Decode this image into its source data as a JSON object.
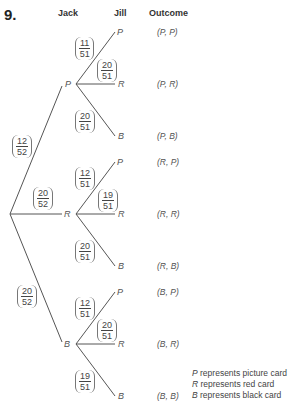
{
  "question_number": "9.",
  "headers": {
    "jack": "Jack",
    "jill": "Jill",
    "outcome": "Outcome"
  },
  "first_level": [
    {
      "node": "P",
      "probability": {
        "num": "12",
        "den": "52"
      }
    },
    {
      "node": "R",
      "probability": {
        "num": "20",
        "den": "52"
      }
    },
    {
      "node": "B",
      "probability": {
        "num": "20",
        "den": "52"
      }
    }
  ],
  "second_level": {
    "P": [
      {
        "node": "P",
        "probability": {
          "num": "11",
          "den": "51"
        },
        "outcome": "(P, P)"
      },
      {
        "node": "R",
        "probability": {
          "num": "20",
          "den": "51"
        },
        "outcome": "(P, R)"
      },
      {
        "node": "B",
        "probability": {
          "num": "20",
          "den": "51"
        },
        "outcome": "(P, B)"
      }
    ],
    "R": [
      {
        "node": "P",
        "probability": {
          "num": "12",
          "den": "51"
        },
        "outcome": "(R, P)"
      },
      {
        "node": "R",
        "probability": {
          "num": "19",
          "den": "51"
        },
        "outcome": "(R, R)"
      },
      {
        "node": "B",
        "probability": {
          "num": "20",
          "den": "51"
        },
        "outcome": "(R, B)"
      }
    ],
    "B": [
      {
        "node": "P",
        "probability": {
          "num": "12",
          "den": "51"
        },
        "outcome": "(B, P)"
      },
      {
        "node": "R",
        "probability": {
          "num": "20",
          "den": "51"
        },
        "outcome": "(B, R)"
      },
      {
        "node": "B",
        "probability": {
          "num": "19",
          "den": "51"
        },
        "outcome": "(B, B)"
      }
    ]
  },
  "legend": [
    {
      "symbol": "P",
      "text": " represents picture card"
    },
    {
      "symbol": "R",
      "text": " represents red card"
    },
    {
      "symbol": "B",
      "text": " represents black card"
    }
  ]
}
